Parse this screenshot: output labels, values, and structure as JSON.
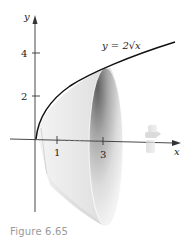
{
  "figure": {
    "caption": "Figure 6.65",
    "curve_label": "y = 2√x",
    "axes": {
      "x_label": "x",
      "y_label": "y",
      "x_ticks": [
        "1",
        "3"
      ],
      "y_ticks": [
        "2",
        "4"
      ]
    },
    "icons": [
      "rotation-arrow-icon"
    ],
    "colors": {
      "curve": "#111111",
      "axis": "#333333",
      "solid_light": "#f2f2f2",
      "solid_dark": "#6e6e6e",
      "caption": "#9a9a9a"
    }
  }
}
